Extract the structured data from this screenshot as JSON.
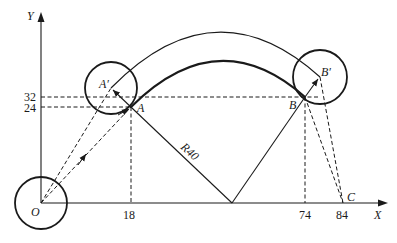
{
  "axes": {
    "x_label": "X",
    "y_label": "Y",
    "origin_label": "O",
    "x_ticks": [
      "18",
      "74",
      "84"
    ],
    "y_ticks": [
      "32",
      "24"
    ]
  },
  "points": {
    "A": "A",
    "A_prime": "A′",
    "B": "B",
    "B_prime": "B′",
    "C": "C"
  },
  "annotations": {
    "radius": "R40"
  },
  "colors": {
    "stroke": "#1a1a1a",
    "background": "#ffffff"
  }
}
